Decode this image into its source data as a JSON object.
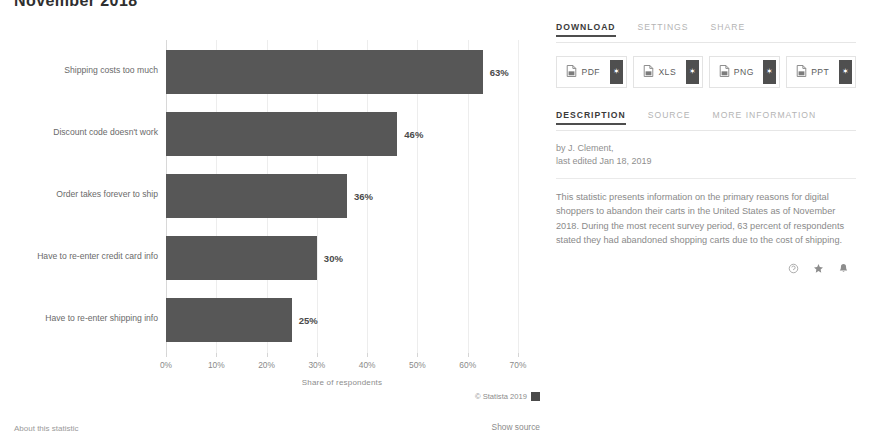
{
  "title": "November 2018",
  "chart_data": {
    "type": "bar",
    "orientation": "horizontal",
    "title": "November 2018",
    "categories": [
      "Shipping costs too much",
      "Discount code doesn't work",
      "Order takes forever to ship",
      "Have to re-enter credit card info",
      "Have to re-enter shipping info"
    ],
    "values": [
      63,
      46,
      36,
      30,
      25
    ],
    "value_labels": [
      "63%",
      "46%",
      "36%",
      "30%",
      "25%"
    ],
    "xlabel": "Share of respondents",
    "ylabel": "",
    "xlim": [
      0,
      70
    ],
    "xticks": [
      0,
      10,
      20,
      30,
      40,
      50,
      60,
      70
    ],
    "xtick_labels": [
      "0%",
      "10%",
      "20%",
      "30%",
      "40%",
      "50%",
      "60%",
      "70%"
    ],
    "grid": true,
    "legend": false,
    "bar_color": "#575757"
  },
  "side_panel": {
    "action_tabs": [
      {
        "label": "DOWNLOAD",
        "active": true
      },
      {
        "label": "SETTINGS",
        "active": false
      },
      {
        "label": "SHARE",
        "active": false
      }
    ],
    "download_buttons": [
      {
        "label": "PDF",
        "icon": "pdf-file-icon",
        "side_glyph": "✶"
      },
      {
        "label": "XLS",
        "icon": "xls-file-icon",
        "side_glyph": "✶"
      },
      {
        "label": "PNG",
        "icon": "png-file-icon",
        "side_glyph": "✶"
      },
      {
        "label": "PPT",
        "icon": "ppt-file-icon",
        "side_glyph": "✶"
      }
    ],
    "info_tabs": [
      {
        "label": "DESCRIPTION",
        "active": true
      },
      {
        "label": "SOURCE",
        "active": false
      },
      {
        "label": "MORE INFORMATION",
        "active": false
      }
    ],
    "byline_author": "by J. Clement,",
    "byline_edited": "last edited Jan 18, 2019",
    "description": "This statistic presents information on the primary reasons for digital shoppers to abandon their carts in the United States as of November 2018. During the most recent survey period, 63 percent of respondents stated they had abandoned shopping carts due to the cost of shipping.",
    "action_icons": [
      {
        "name": "citation-icon"
      },
      {
        "name": "star-icon"
      },
      {
        "name": "bell-icon"
      }
    ]
  },
  "footer": {
    "copyright": "© Statista 2019",
    "about_link": "About this statistic",
    "show_source": "Show source"
  },
  "colors": {
    "bar": "#575757",
    "accent_dark": "#4d4d4d",
    "muted_text": "#8a8a8a"
  }
}
